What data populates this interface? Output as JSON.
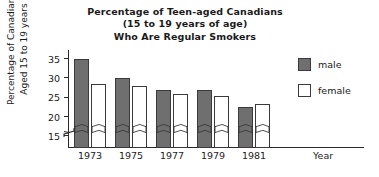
{
  "chart_data": {
    "type": "bar",
    "title": "Percentage of Teen-aged Canadians (15 to 19 years of age) Who Are Regular Smokers",
    "title_lines": [
      "Percentage of Teen-aged Canadians",
      "(15 to 19 years of age)",
      "Who Are Regular Smokers"
    ],
    "xlabel": "Year",
    "ylabel": "Percentage of Canadians Aged 15 to 19 years",
    "ylabel_lines": [
      "Percentage of Canadians",
      "Aged 15 to 19 years"
    ],
    "categories": [
      "1973",
      "1975",
      "1977",
      "1979",
      "1981"
    ],
    "series": [
      {
        "name": "male",
        "color": "#6f6f6f",
        "values": [
          35,
          30,
          27,
          27,
          22.5
        ]
      },
      {
        "name": "female",
        "color": "#ffffff",
        "values": [
          28.5,
          28,
          26,
          25.5,
          23.5
        ]
      }
    ],
    "yticks": [
      35,
      30,
      25,
      20,
      15
    ],
    "ylim": [
      12,
      37
    ],
    "axis_broken": true,
    "grid": false,
    "legend_position": "right",
    "legend_entries": [
      "male",
      "female"
    ]
  }
}
